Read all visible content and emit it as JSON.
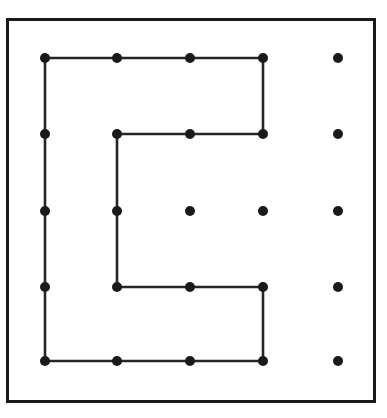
{
  "figure": {
    "background_color": "#ffffff",
    "ink_color": "#1a1a1a",
    "path_color": "#262626"
  },
  "frame": {
    "name": "outer-square-border",
    "x": 7.5,
    "y": 19.5,
    "width": 367,
    "height": 382,
    "stroke_width": 3,
    "color": "#1a1a1a"
  },
  "grid": {
    "columns": 5,
    "rows": 5,
    "column_x": [
      45,
      117,
      190,
      263,
      338
    ],
    "row_y": [
      58,
      134,
      211,
      287,
      361
    ],
    "dot_radius": 5,
    "dot_color": "#1a1a1a"
  },
  "lattice_points": [
    {
      "col": 0,
      "row": 0,
      "x": 45,
      "y": 58,
      "on_path": true
    },
    {
      "col": 1,
      "row": 0,
      "x": 117,
      "y": 58,
      "on_path": true
    },
    {
      "col": 2,
      "row": 0,
      "x": 190,
      "y": 58,
      "on_path": true
    },
    {
      "col": 3,
      "row": 0,
      "x": 263,
      "y": 58,
      "on_path": true
    },
    {
      "col": 4,
      "row": 0,
      "x": 338,
      "y": 58,
      "on_path": false
    },
    {
      "col": 0,
      "row": 1,
      "x": 45,
      "y": 134,
      "on_path": true
    },
    {
      "col": 1,
      "row": 1,
      "x": 117,
      "y": 134,
      "on_path": true
    },
    {
      "col": 2,
      "row": 1,
      "x": 190,
      "y": 134,
      "on_path": true
    },
    {
      "col": 3,
      "row": 1,
      "x": 263,
      "y": 134,
      "on_path": true
    },
    {
      "col": 4,
      "row": 1,
      "x": 338,
      "y": 134,
      "on_path": false
    },
    {
      "col": 0,
      "row": 2,
      "x": 45,
      "y": 211,
      "on_path": true
    },
    {
      "col": 1,
      "row": 2,
      "x": 117,
      "y": 211,
      "on_path": true
    },
    {
      "col": 2,
      "row": 2,
      "x": 190,
      "y": 211,
      "on_path": false
    },
    {
      "col": 3,
      "row": 2,
      "x": 263,
      "y": 211,
      "on_path": false
    },
    {
      "col": 4,
      "row": 2,
      "x": 338,
      "y": 211,
      "on_path": false
    },
    {
      "col": 0,
      "row": 3,
      "x": 45,
      "y": 287,
      "on_path": true
    },
    {
      "col": 1,
      "row": 3,
      "x": 117,
      "y": 287,
      "on_path": true
    },
    {
      "col": 2,
      "row": 3,
      "x": 190,
      "y": 287,
      "on_path": true
    },
    {
      "col": 3,
      "row": 3,
      "x": 263,
      "y": 287,
      "on_path": true
    },
    {
      "col": 4,
      "row": 3,
      "x": 338,
      "y": 287,
      "on_path": false
    },
    {
      "col": 0,
      "row": 4,
      "x": 45,
      "y": 361,
      "on_path": true
    },
    {
      "col": 1,
      "row": 4,
      "x": 117,
      "y": 361,
      "on_path": true
    },
    {
      "col": 2,
      "row": 4,
      "x": 190,
      "y": 361,
      "on_path": true
    },
    {
      "col": 3,
      "row": 4,
      "x": 263,
      "y": 361,
      "on_path": true
    },
    {
      "col": 4,
      "row": 4,
      "x": 338,
      "y": 361,
      "on_path": false
    }
  ],
  "polygon": {
    "closed": true,
    "vertex_count": 8,
    "vertices_grid": [
      {
        "col": 0,
        "row": 0
      },
      {
        "col": 3,
        "row": 0
      },
      {
        "col": 3,
        "row": 1
      },
      {
        "col": 1,
        "row": 1
      },
      {
        "col": 1,
        "row": 3
      },
      {
        "col": 3,
        "row": 3
      },
      {
        "col": 3,
        "row": 4
      },
      {
        "col": 0,
        "row": 4
      }
    ],
    "points_attr": "45,58 263,58 263,134 117,134 117,287 263,287 263,361 45,361 45,58",
    "stroke_width": 2.6,
    "color": "#262626"
  },
  "chart_data": {
    "type": "scatter",
    "xlabel": "",
    "ylabel": "",
    "x": [
      0,
      1,
      2,
      3,
      4,
      0,
      1,
      2,
      3,
      4,
      0,
      1,
      2,
      3,
      4,
      0,
      1,
      2,
      3,
      4,
      0,
      1,
      2,
      3,
      4
    ],
    "y": [
      4,
      4,
      4,
      4,
      4,
      3,
      3,
      3,
      3,
      3,
      2,
      2,
      2,
      2,
      2,
      1,
      1,
      1,
      1,
      1,
      0,
      0,
      0,
      0,
      0
    ],
    "xlim": [
      -0.6,
      4.6
    ],
    "ylim": [
      -0.6,
      4.6
    ],
    "grid": false,
    "legend": "none",
    "annotations": [
      "Closed polygon path through 16 boundary lattice points",
      "Interior lattice points not on path: (2,2), (3,2)",
      "Isolated column of 5 dots at x = 4"
    ]
  }
}
